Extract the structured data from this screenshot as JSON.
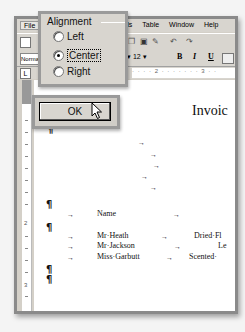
{
  "menubar": {
    "file": "File",
    "items": [
      "Tools",
      "Table",
      "Window",
      "Help"
    ]
  },
  "formatting": {
    "style": "Normal",
    "font_size": "12",
    "bold": "B",
    "italic": "I",
    "underline": "U"
  },
  "ruler": {
    "tab_selector": "L",
    "marks": "· · · · 2 · · · · · · · 3 · ·",
    "vertical_numbers": [
      "2",
      "3"
    ]
  },
  "alignment_dialog": {
    "legend": "Alignment",
    "options": [
      {
        "label": "Left",
        "accel": "L",
        "selected": false
      },
      {
        "label": "Center",
        "accel": "C",
        "selected": true
      },
      {
        "label": "Right",
        "accel": "R",
        "selected": false
      }
    ]
  },
  "ok_button": {
    "label": "OK"
  },
  "document": {
    "title": "Invoic",
    "pilcrow": "¶",
    "tab_arrow": "→",
    "header_name": "Name",
    "rows": [
      {
        "name": "Mr·Heath",
        "item": "Dried·Fl"
      },
      {
        "name": "Mr·Jackson",
        "item": "Le"
      },
      {
        "name": "Miss·Garbutt",
        "item": "Scented·"
      }
    ]
  }
}
